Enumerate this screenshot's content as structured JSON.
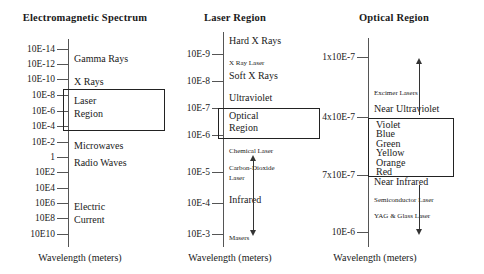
{
  "figure": {
    "axis_caption": "Wavelength (meters)",
    "panels": [
      {
        "id": "electromagnetic-spectrum",
        "title": "Electromagnetic Spectrum",
        "ticks": [
          {
            "label": "10E-14",
            "y": 49
          },
          {
            "label": "10E-12",
            "y": 64
          },
          {
            "label": "10E-10",
            "y": 79
          },
          {
            "label": "10E-8",
            "y": 95
          },
          {
            "label": "10E-6",
            "y": 111
          },
          {
            "label": "10E-4",
            "y": 126
          },
          {
            "label": "10E-2",
            "y": 142
          },
          {
            "label": "1",
            "y": 157
          },
          {
            "label": "10E2",
            "y": 172
          },
          {
            "label": "10E4",
            "y": 188
          },
          {
            "label": "10E6",
            "y": 203
          },
          {
            "label": "10E8",
            "y": 218
          },
          {
            "label": "10E10",
            "y": 234
          }
        ],
        "regions": [
          {
            "label": "Gamma Rays",
            "y": 53
          },
          {
            "label": "X Rays",
            "y": 76
          },
          {
            "label": "Microwaves",
            "y": 140
          },
          {
            "label": "Radio Waves",
            "y": 157
          },
          {
            "label": "Electric",
            "y": 201
          },
          {
            "label": "Current",
            "y": 214
          }
        ],
        "highlight": {
          "lines": [
            "Laser",
            "Region"
          ],
          "top": 89,
          "height": 40,
          "left": 63,
          "width": 100
        }
      },
      {
        "id": "laser-region",
        "title": "Laser Region",
        "ticks": [
          {
            "label": "10E-9",
            "y": 54
          },
          {
            "label": "10E-8",
            "y": 81
          },
          {
            "label": "10E-7",
            "y": 108
          },
          {
            "label": "10E-6",
            "y": 135
          },
          {
            "label": "10E-5",
            "y": 172
          },
          {
            "label": "10E-4",
            "y": 203
          },
          {
            "label": "10E-3",
            "y": 234
          }
        ],
        "regions": [
          {
            "label": "Hard X Rays",
            "y": 40,
            "size": "lg"
          },
          {
            "label": "X Ray Laser",
            "y": 62,
            "size": "sm"
          },
          {
            "label": "Soft X Rays",
            "y": 76,
            "size": "lg"
          },
          {
            "label": "Ultraviolet",
            "y": 98,
            "size": "lg"
          },
          {
            "label": "Chemical  Laser",
            "y": 150,
            "size": "sm"
          },
          {
            "label": "Carbon-Dioxide",
            "y": 167,
            "size": "sm"
          },
          {
            "label": "Laser",
            "y": 177,
            "size": "sm"
          },
          {
            "label": "Infrared",
            "y": 199,
            "size": "lg"
          },
          {
            "label": "Masers",
            "y": 236,
            "size": "sm"
          }
        ],
        "highlight": {
          "lines": [
            "Optical",
            "Region"
          ],
          "top": 108,
          "height": 29,
          "left": 218,
          "width": 100
        },
        "arrow": {
          "x": 253,
          "top": 157,
          "bottom": 235,
          "heads": "both"
        }
      },
      {
        "id": "optical-region",
        "title": "Optical Region",
        "ticks": [
          {
            "label": "1x10E-7",
            "y": 57
          },
          {
            "label": "4x10E-7",
            "y": 117
          },
          {
            "label": "7x10E-7",
            "y": 175
          },
          {
            "label": "10E-6",
            "y": 232
          }
        ],
        "regions": [
          {
            "label": "Excimer Lasers",
            "y": 92,
            "size": "sm"
          },
          {
            "label": "Near Ultraviolet",
            "y": 108,
            "size": "lg"
          },
          {
            "label": "Near Infrared",
            "y": 180,
            "size": "lg"
          },
          {
            "label": "Semiconductor Laser",
            "y": 199,
            "size": "sm"
          },
          {
            "label": "YAG & Glass Laser",
            "y": 215,
            "size": "sm"
          }
        ],
        "colors": [
          "Violet",
          "Blue",
          "Green",
          "Yellow",
          "Orange",
          "Red"
        ],
        "highlight": {
          "top": 118,
          "height": 57,
          "left": 368,
          "width": 84
        },
        "arrow_up": {
          "x": 419,
          "top": 58,
          "bottom": 115
        },
        "arrow_down": {
          "x": 419,
          "top": 185,
          "bottom": 236
        }
      }
    ]
  }
}
